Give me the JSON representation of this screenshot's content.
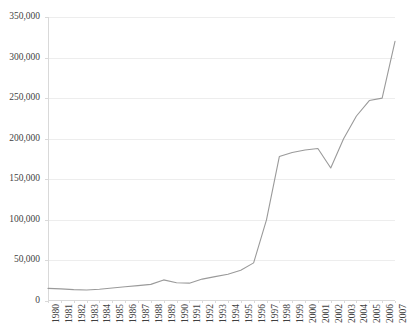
{
  "chart_data": {
    "type": "line",
    "title": "",
    "subtitle": "",
    "xlabel": "",
    "ylabel": "",
    "grid": true,
    "legend": false,
    "legend_position": "none",
    "line_color": "#9a9a9a",
    "gridline_color": "#ededed",
    "axis_color": "#d9d9d9",
    "text_color": "#3f3f3f",
    "xlim": [
      1980,
      2007
    ],
    "ylim": [
      0,
      350000
    ],
    "ytick_step": 50000,
    "ytick_labels": [
      "0",
      "50,000",
      "100,000",
      "150,000",
      "200,000",
      "250,000",
      "300,000",
      "350,000"
    ],
    "ytick_values": [
      0,
      50000,
      100000,
      150000,
      200000,
      250000,
      300000,
      350000
    ],
    "categories": [
      "1980",
      "1981",
      "1982",
      "1983",
      "1984",
      "1985",
      "1986",
      "1987",
      "1988",
      "1989",
      "1990",
      "1991",
      "1992",
      "1993",
      "1994",
      "1995",
      "1996",
      "1997",
      "1998",
      "1999",
      "2000",
      "2001",
      "2002",
      "2003",
      "2004",
      "2005",
      "2006",
      "2007"
    ],
    "values": [
      15500,
      15000,
      14000,
      13500,
      14500,
      16000,
      17500,
      19000,
      20500,
      26000,
      22500,
      22000,
      27000,
      30000,
      33000,
      38000,
      47000,
      100000,
      178000,
      183000,
      186000,
      188000,
      164000,
      200000,
      228000,
      247000,
      250000,
      320000
    ],
    "series": [
      {
        "name": "Series 1",
        "values": [
          15500,
          15000,
          14000,
          13500,
          14500,
          16000,
          17500,
          19000,
          20500,
          26000,
          22500,
          22000,
          27000,
          30000,
          33000,
          38000,
          47000,
          100000,
          178000,
          183000,
          186000,
          188000,
          164000,
          200000,
          228000,
          247000,
          250000,
          320000
        ]
      }
    ],
    "annotations": []
  }
}
